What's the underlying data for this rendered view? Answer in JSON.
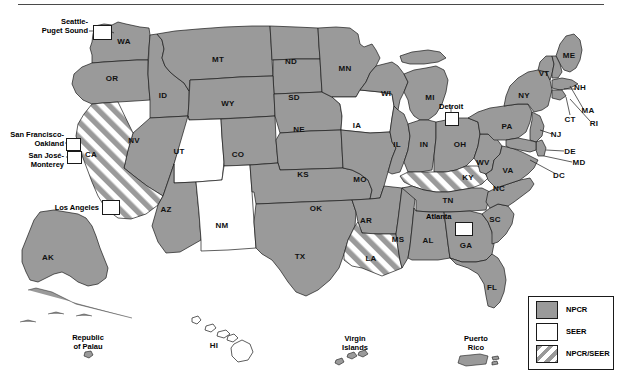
{
  "map": {
    "title_rule": true,
    "colors": {
      "npcr_fill": "#9a9a9a",
      "seer_fill": "#ffffff",
      "border": "#1a1a1a",
      "hatch": "#9a9a9a",
      "text": "#111111"
    },
    "state_labels": [
      {
        "id": "WA",
        "text": "WA",
        "x": 124,
        "y": 42,
        "cat": "npcr"
      },
      {
        "id": "OR",
        "text": "OR",
        "x": 112,
        "y": 79,
        "cat": "npcr"
      },
      {
        "id": "ID",
        "text": "ID",
        "x": 163,
        "y": 96,
        "cat": "npcr"
      },
      {
        "id": "MT",
        "text": "MT",
        "x": 218,
        "y": 60,
        "cat": "npcr"
      },
      {
        "id": "ND",
        "text": "ND",
        "x": 291,
        "y": 62,
        "cat": "npcr"
      },
      {
        "id": "SD",
        "text": "SD",
        "x": 294,
        "y": 98,
        "cat": "npcr"
      },
      {
        "id": "WY",
        "text": "WY",
        "x": 228,
        "y": 104,
        "cat": "npcr"
      },
      {
        "id": "NV",
        "text": "NV",
        "x": 134,
        "y": 141,
        "cat": "npcr"
      },
      {
        "id": "UT",
        "text": "UT",
        "x": 179,
        "y": 152,
        "cat": "seer"
      },
      {
        "id": "CO",
        "text": "CO",
        "x": 238,
        "y": 155,
        "cat": "npcr"
      },
      {
        "id": "NE",
        "text": "NE",
        "x": 299,
        "y": 130,
        "cat": "npcr"
      },
      {
        "id": "KS",
        "text": "KS",
        "x": 303,
        "y": 175,
        "cat": "npcr"
      },
      {
        "id": "CA",
        "text": "CA",
        "x": 91,
        "y": 155,
        "cat": "both"
      },
      {
        "id": "AZ",
        "text": "AZ",
        "x": 166,
        "y": 210,
        "cat": "npcr"
      },
      {
        "id": "NM",
        "text": "NM",
        "x": 222,
        "y": 226,
        "cat": "seer"
      },
      {
        "id": "OK",
        "text": "OK",
        "x": 316,
        "y": 209,
        "cat": "npcr"
      },
      {
        "id": "TX",
        "text": "TX",
        "x": 300,
        "y": 257,
        "cat": "npcr"
      },
      {
        "id": "MN",
        "text": "MN",
        "x": 345,
        "y": 69,
        "cat": "npcr"
      },
      {
        "id": "IA",
        "text": "IA",
        "x": 357,
        "y": 126,
        "cat": "seer"
      },
      {
        "id": "MO",
        "text": "MO",
        "x": 360,
        "y": 180,
        "cat": "npcr"
      },
      {
        "id": "AR",
        "text": "AR",
        "x": 366,
        "y": 221,
        "cat": "npcr"
      },
      {
        "id": "LA",
        "text": "LA",
        "x": 371,
        "y": 259,
        "cat": "both"
      },
      {
        "id": "WI",
        "text": "WI",
        "x": 386,
        "y": 94,
        "cat": "npcr"
      },
      {
        "id": "IL",
        "text": "IL",
        "x": 397,
        "y": 145,
        "cat": "npcr"
      },
      {
        "id": "MS",
        "text": "MS",
        "x": 398,
        "y": 240,
        "cat": "npcr"
      },
      {
        "id": "MI",
        "text": "MI",
        "x": 430,
        "y": 98,
        "cat": "npcr"
      },
      {
        "id": "IN",
        "text": "IN",
        "x": 424,
        "y": 145,
        "cat": "npcr"
      },
      {
        "id": "OH",
        "text": "OH",
        "x": 460,
        "y": 145,
        "cat": "npcr"
      },
      {
        "id": "KY",
        "text": "KY",
        "x": 468,
        "y": 178,
        "cat": "both"
      },
      {
        "id": "TN",
        "text": "TN",
        "x": 448,
        "y": 201,
        "cat": "npcr"
      },
      {
        "id": "AL",
        "text": "AL",
        "x": 428,
        "y": 241,
        "cat": "npcr"
      },
      {
        "id": "GA",
        "text": "GA",
        "x": 466,
        "y": 246,
        "cat": "npcr"
      },
      {
        "id": "FL",
        "text": "FL",
        "x": 492,
        "y": 288,
        "cat": "npcr"
      },
      {
        "id": "SC",
        "text": "SC",
        "x": 495,
        "y": 220,
        "cat": "npcr"
      },
      {
        "id": "NC",
        "text": "NC",
        "x": 499,
        "y": 189,
        "cat": "npcr"
      },
      {
        "id": "WV",
        "text": "WV",
        "x": 483,
        "y": 163,
        "cat": "npcr"
      },
      {
        "id": "VA",
        "text": "VA",
        "x": 508,
        "y": 171,
        "cat": "npcr"
      },
      {
        "id": "PA",
        "text": "PA",
        "x": 507,
        "y": 127,
        "cat": "npcr"
      },
      {
        "id": "NY",
        "text": "NY",
        "x": 524,
        "y": 96,
        "cat": "npcr"
      },
      {
        "id": "VT",
        "text": "VT",
        "x": 544,
        "y": 74,
        "cat": "npcr"
      },
      {
        "id": "ME",
        "text": "ME",
        "x": 569,
        "y": 56,
        "cat": "npcr"
      },
      {
        "id": "NH",
        "text": "NH",
        "x": 580,
        "y": 88,
        "cat": "npcr"
      },
      {
        "id": "MA",
        "text": "MA",
        "x": 588,
        "y": 111,
        "cat": "npcr"
      },
      {
        "id": "CT",
        "text": "CT",
        "x": 570,
        "y": 120,
        "cat": "npcr"
      },
      {
        "id": "RI",
        "text": "RI",
        "x": 594,
        "y": 124,
        "cat": "npcr"
      },
      {
        "id": "NJ",
        "text": "NJ",
        "x": 556,
        "y": 135,
        "cat": "npcr"
      },
      {
        "id": "DE",
        "text": "DE",
        "x": 570,
        "y": 152,
        "cat": "npcr"
      },
      {
        "id": "MD",
        "text": "MD",
        "x": 579,
        "y": 163,
        "cat": "npcr"
      },
      {
        "id": "DC",
        "text": "DC",
        "x": 559,
        "y": 176,
        "cat": "npcr"
      },
      {
        "id": "AK",
        "text": "AK",
        "x": 48,
        "y": 258,
        "cat": "npcr"
      },
      {
        "id": "HI",
        "text": "HI",
        "x": 214,
        "y": 346,
        "cat": "seer"
      }
    ],
    "city_callouts": [
      {
        "id": "seattle-puget-sound",
        "label": "Seattle-\nPuget Sound",
        "align": "right",
        "text_x": 88,
        "text_y": 17,
        "box_x": 93,
        "box_y": 25,
        "box_w": 17,
        "box_h": 13
      },
      {
        "id": "san-francisco-oakland",
        "label": "San Francisco-\nOakland",
        "align": "right",
        "text_x": 64,
        "text_y": 130,
        "box_x": 66,
        "box_y": 138,
        "box_w": 13,
        "box_h": 11
      },
      {
        "id": "san-jose-monterey",
        "label": "San José-\nMonterey",
        "align": "right",
        "text_x": 64,
        "text_y": 151,
        "box_x": 67,
        "box_y": 151,
        "box_w": 13,
        "box_h": 11
      },
      {
        "id": "los-angeles",
        "label": "Los Angeles",
        "align": "right",
        "text_x": 99,
        "text_y": 203,
        "box_x": 102,
        "box_y": 200,
        "box_w": 16,
        "box_h": 13
      },
      {
        "id": "detroit",
        "label": "Detroit",
        "align": "left",
        "text_x": 439,
        "text_y": 102,
        "box_x": 445,
        "box_y": 112,
        "box_w": 12,
        "box_h": 12
      },
      {
        "id": "atlanta",
        "label": "Atlanta",
        "align": "left",
        "text_x": 426,
        "text_y": 212,
        "box_x": 455,
        "box_y": 222,
        "box_w": 16,
        "box_h": 12
      }
    ],
    "territories": [
      {
        "id": "republic-of-palau",
        "label": "Republic\nof Palau",
        "x": 88,
        "y": 333,
        "cat": "npcr"
      },
      {
        "id": "virgin-islands",
        "label": "Virgin\nIslands",
        "x": 355,
        "y": 334,
        "cat": "npcr"
      },
      {
        "id": "puerto-rico",
        "label": "Puerto\nRico",
        "x": 476,
        "y": 334,
        "cat": "npcr"
      },
      {
        "id": "hawaii",
        "label": "HI",
        "x": 214,
        "y": 346,
        "cat": "seer"
      }
    ]
  },
  "legend": {
    "items": [
      {
        "id": "npcr",
        "label": "NPCR",
        "swatch": "npcr"
      },
      {
        "id": "seer",
        "label": "SEER",
        "swatch": "seer"
      },
      {
        "id": "npcr-seer",
        "label": "NPCR/SEER",
        "swatch": "both"
      }
    ]
  }
}
